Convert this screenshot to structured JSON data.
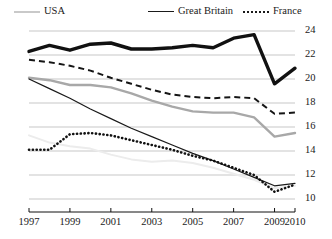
{
  "chart_data": {
    "type": "line",
    "title": "",
    "xlabel": "",
    "ylabel": "",
    "grid": true,
    "legend_position": "top",
    "x": [
      1997,
      1998,
      1999,
      2000,
      2001,
      2002,
      2003,
      2004,
      2005,
      2006,
      2007,
      2008,
      2009,
      2010
    ],
    "xticks": [
      "1997",
      "1999",
      "2001",
      "2003",
      "2005",
      "2007",
      "2009",
      "2010"
    ],
    "xtick_values": [
      1997,
      1999,
      2001,
      2003,
      2005,
      2007,
      2009,
      2010
    ],
    "xlim": [
      1997,
      2010
    ],
    "yticks": [
      "24",
      "22",
      "20",
      "18",
      "16",
      "14",
      "12",
      "10"
    ],
    "ytick_values": [
      24,
      22,
      20,
      18,
      16,
      14,
      12,
      10
    ],
    "ylim": [
      9.0,
      25.0
    ],
    "series": [
      {
        "name": "series-thick-black",
        "style": "thick-solid",
        "color": "#111111",
        "width": 3.4,
        "values": [
          22.3,
          22.8,
          22.4,
          22.9,
          23.0,
          22.5,
          22.5,
          22.6,
          22.8,
          22.6,
          23.4,
          23.7,
          19.6,
          20.9
        ]
      },
      {
        "name": "series-dashed-black",
        "style": "dashed",
        "color": "#151515",
        "width": 2.0,
        "values": [
          21.6,
          21.4,
          21.1,
          20.7,
          20.1,
          19.6,
          19.1,
          18.7,
          18.5,
          18.4,
          18.5,
          18.4,
          17.1,
          17.2
        ]
      },
      {
        "name": "USA",
        "style": "solid",
        "color": "#a8a8a8",
        "width": 2.4,
        "values": [
          20.1,
          19.9,
          19.5,
          19.5,
          19.3,
          18.8,
          18.2,
          17.7,
          17.3,
          17.2,
          17.2,
          16.8,
          15.2,
          15.5
        ]
      },
      {
        "name": "Great Britain",
        "style": "solid",
        "color": "#1a1a1a",
        "width": 1.2,
        "values": [
          20.0,
          19.2,
          18.4,
          17.5,
          16.7,
          15.9,
          15.2,
          14.5,
          13.8,
          13.2,
          12.5,
          11.8,
          11.1,
          11.3
        ]
      },
      {
        "name": "France",
        "style": "dotted",
        "color": "#111111",
        "width": 2.6,
        "values": [
          14.1,
          14.1,
          15.4,
          15.5,
          15.3,
          14.9,
          14.5,
          14.1,
          13.6,
          13.2,
          12.6,
          12.0,
          10.6,
          11.2
        ]
      },
      {
        "name": "series-faint-gray",
        "style": "solid",
        "color": "#ececec",
        "width": 2.0,
        "values": [
          15.3,
          14.7,
          14.4,
          14.2,
          13.7,
          13.3,
          13.1,
          13.2,
          13.0,
          12.6,
          12.1,
          11.6,
          10.9,
          11.1
        ]
      }
    ]
  },
  "legend": {
    "items": [
      {
        "label": "USA",
        "swatch": "solid-gray"
      },
      {
        "label": "Great Britain",
        "swatch": "solid-black"
      },
      {
        "label": "France",
        "swatch": "dotted"
      }
    ]
  }
}
